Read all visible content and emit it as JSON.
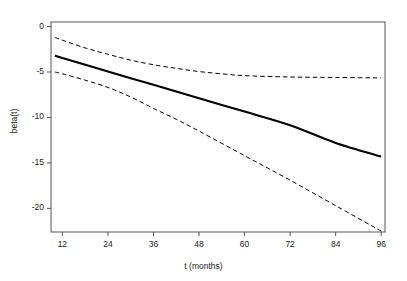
{
  "chart_data": {
    "type": "line",
    "title": "",
    "xlabel": "t (months)",
    "ylabel": "beta(t)",
    "xlim": [
      9,
      97
    ],
    "ylim": [
      -22.6,
      0.5
    ],
    "xticks": [
      12,
      24,
      36,
      48,
      60,
      72,
      84,
      96
    ],
    "yticks": [
      0,
      -5,
      -10,
      -15,
      -20
    ],
    "xtick_labels": [
      "12",
      "24",
      "36",
      "48",
      "60",
      "72",
      "84",
      "96"
    ],
    "ytick_labels": [
      "0",
      "-5",
      "-10",
      "-15",
      "-20"
    ],
    "grid": false,
    "legend": "none",
    "axis_color": "#555555",
    "line_color": "#000000",
    "series": [
      {
        "name": "beta(t) estimate",
        "style": "solid",
        "width": 2.1,
        "x": [
          10,
          12,
          24,
          36,
          48,
          60,
          72,
          84,
          96
        ],
        "values": [
          -3.2,
          -3.45,
          -4.95,
          -6.4,
          -7.9,
          -9.35,
          -10.85,
          -12.8,
          -14.3
        ]
      },
      {
        "name": "upper 95% confidence band",
        "style": "dashed",
        "width": 1.0,
        "x": [
          10,
          12,
          18,
          24,
          30,
          36,
          42,
          48,
          54,
          60,
          72,
          84,
          96
        ],
        "values": [
          -1.2,
          -1.5,
          -2.35,
          -3.05,
          -3.7,
          -4.2,
          -4.6,
          -4.95,
          -5.2,
          -5.4,
          -5.55,
          -5.6,
          -5.65
        ]
      },
      {
        "name": "lower 95% confidence band",
        "style": "dashed",
        "width": 1.0,
        "x": [
          10,
          12,
          18,
          24,
          30,
          36,
          42,
          48,
          60,
          72,
          84,
          96
        ],
        "values": [
          -5.0,
          -5.2,
          -5.9,
          -6.7,
          -7.75,
          -9.0,
          -10.2,
          -11.5,
          -14.2,
          -16.9,
          -19.7,
          -22.5
        ]
      }
    ]
  }
}
